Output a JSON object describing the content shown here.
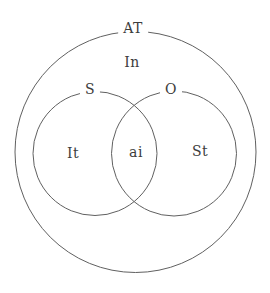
{
  "diagram": {
    "colors": {
      "background": "#ffffff",
      "circle_stroke": "#606060",
      "label_text": "#3d3d3d"
    },
    "labels": {
      "outer_circle": "AT",
      "outer_region": "In",
      "left_circle": "S",
      "right_circle": "O",
      "left_region": "It",
      "intersection_region": "ai",
      "right_region": "St"
    }
  }
}
